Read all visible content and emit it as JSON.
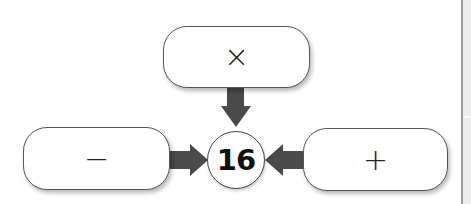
{
  "diagram": {
    "center_value": "16",
    "boxes": {
      "top": {
        "symbol": "×",
        "operation": "multiply"
      },
      "left": {
        "symbol": "−",
        "operation": "subtract"
      },
      "right": {
        "symbol": "+",
        "operation": "add"
      }
    },
    "arrow_color": "#4a4a4a"
  }
}
